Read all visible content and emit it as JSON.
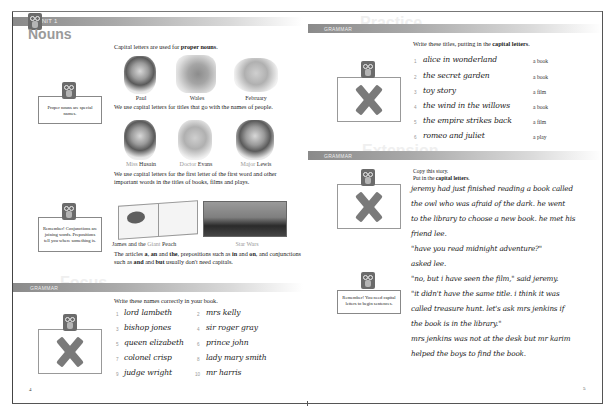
{
  "left_page": {
    "unit_label": "UNIT 1",
    "title": "Nouns",
    "intro_text": "Capital letters are used for",
    "intro_bold": "proper nouns",
    "intro_end": ".",
    "note_1": "Proper nouns are special names.",
    "pictures_row1": [
      {
        "caption": "Paul",
        "kind": "face"
      },
      {
        "caption": "Wales",
        "kind": "map"
      },
      {
        "caption": "February",
        "kind": "calendar"
      }
    ],
    "titles_text": "We use capital letters for titles that go with the names of people.",
    "pictures_row2": [
      {
        "caption_title": "Miss",
        "caption_name": "Husain"
      },
      {
        "caption_title": "Doctor",
        "caption_name": "Evans"
      },
      {
        "caption_title": "Major",
        "caption_name": "Lewis"
      }
    ],
    "works_text": "We use capital letters for the first letter of the first word and other important words in the titles of books, films and plays.",
    "note_2": "Remember! Conjunctions are joining words. Prepositions tell you where something is.",
    "book_caption_a": "James and the",
    "book_caption_b": "Giant",
    "book_caption_c": "Peach",
    "film_caption": "Star Wars",
    "articles_text": {
      "p1": "The articles ",
      "a": "a",
      "p2": ", ",
      "an": "an",
      "p3": " and ",
      "the": "the",
      "p4": ", prepositions such as ",
      "in": "in",
      "p5": " and ",
      "on": "on",
      "p6": ", and conjunctions such as ",
      "and": "and",
      "p7": " and ",
      "but": "but",
      "p8": " usually don't need capitals."
    },
    "grammar_section": {
      "bar_label": "GRAMMAR",
      "ghost_word": "Focus",
      "instruction": "Write these names correctly in your book.",
      "items": [
        {
          "num": "1",
          "text": "lord lambeth"
        },
        {
          "num": "2",
          "text": "mrs kelly"
        },
        {
          "num": "3",
          "text": "bishop jones"
        },
        {
          "num": "4",
          "text": "sir roger gray"
        },
        {
          "num": "5",
          "text": "queen elizabeth"
        },
        {
          "num": "6",
          "text": "prince john"
        },
        {
          "num": "7",
          "text": "colonel crisp"
        },
        {
          "num": "8",
          "text": "lady mary smith"
        },
        {
          "num": "9",
          "text": "judge wright"
        },
        {
          "num": "10",
          "text": "mr harris"
        }
      ]
    },
    "page_number": "4"
  },
  "right_page": {
    "section_1": {
      "bar_label": "GRAMMAR",
      "ghost_word": "Practice",
      "instruction_start": "Write these titles, putting in the",
      "instruction_bold": "capital letters",
      "instruction_end": ".",
      "items": [
        {
          "num": "1",
          "text": "alice in wonderland",
          "kind": "a book"
        },
        {
          "num": "2",
          "text": "the secret garden",
          "kind": "a book"
        },
        {
          "num": "3",
          "text": "toy story",
          "kind": "a film"
        },
        {
          "num": "4",
          "text": "the wind in the willows",
          "kind": "a book"
        },
        {
          "num": "5",
          "text": "the empire strikes back",
          "kind": "a film"
        },
        {
          "num": "6",
          "text": "romeo and juliet",
          "kind": "a play"
        }
      ]
    },
    "section_2": {
      "bar_label": "GRAMMAR",
      "ghost_word": "Extension",
      "instruction_line1": "Copy this story.",
      "instruction_line2_start": "Put in the",
      "instruction_line2_bold": "capital letters",
      "instruction_line2_end": ".",
      "story_lines": [
        "jeremy had just finished reading a book called",
        "the owl who was afraid of the dark. he went",
        "to the library to choose a new book. he met his",
        "friend lee.",
        "\"have you read midnight adventure?\"",
        "asked lee.",
        "\"no, but i have seen the film,\" said jeremy.",
        "\"it didn't have the same title. i think it was",
        "called treasure hunt. let's ask mrs jenkins if",
        "the book is in the library.\"",
        "mrs jenkins was not at the desk but mr karim",
        "helped the boys to find the book."
      ],
      "note": "Remember! You need capital letters to begin sentences."
    },
    "page_number": "5"
  }
}
